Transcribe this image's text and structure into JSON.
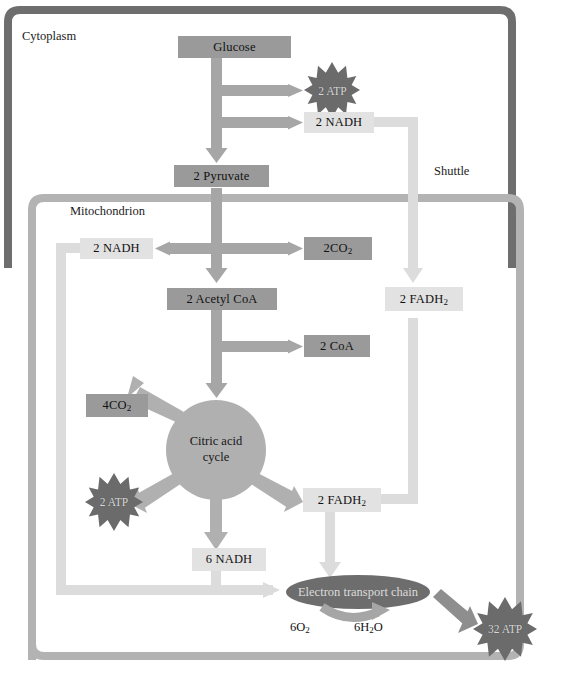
{
  "diagram": {
    "compartments": [
      {
        "id": "cytoplasm",
        "label": "Cytoplasm"
      },
      {
        "id": "mitochondrion",
        "label": "Mitochondrion"
      }
    ],
    "annotations": [
      {
        "id": "shuttle",
        "label": "Shuttle"
      }
    ],
    "nodes": [
      {
        "id": "glucose",
        "label": "Glucose",
        "style": "box-dark"
      },
      {
        "id": "atp2-glyc",
        "label": "2 ATP",
        "style": "starburst"
      },
      {
        "id": "nadh2-cyto",
        "label": "2 NADH",
        "style": "box-light"
      },
      {
        "id": "pyruvate2",
        "label": "2 Pyruvate",
        "style": "box-dark"
      },
      {
        "id": "nadh2-mito",
        "label": "2 NADH",
        "style": "box-light"
      },
      {
        "id": "co2-2",
        "label_html": "2CO<sub>2</sub>",
        "label": "2CO2",
        "style": "box-dark"
      },
      {
        "id": "acetylcoa2",
        "label": "2 Acetyl CoA",
        "style": "box-dark"
      },
      {
        "id": "fadh2-upper",
        "label_html": "2 FADH<sub>2</sub>",
        "label": "2 FADH2",
        "style": "box-light"
      },
      {
        "id": "coa2",
        "label": "2 CoA",
        "style": "box-dark"
      },
      {
        "id": "co2-4",
        "label_html": "4CO<sub>2</sub>",
        "label": "4CO2",
        "style": "box-dark"
      },
      {
        "id": "citric-acid-cycle",
        "label_line1": "Citric acid",
        "label_line2": "cycle",
        "style": "circle"
      },
      {
        "id": "atp2-krebs",
        "label": "2 ATP",
        "style": "starburst"
      },
      {
        "id": "fadh2-lower",
        "label_html": "2 FADH<sub>2</sub>",
        "label": "2 FADH2",
        "style": "box-light"
      },
      {
        "id": "nadh6",
        "label": "6 NADH",
        "style": "box-light"
      },
      {
        "id": "etc",
        "label": "Electron transport chain",
        "style": "ellipse"
      },
      {
        "id": "o2",
        "label_html": "6O<sub>2</sub>",
        "label": "6O2",
        "style": "plain"
      },
      {
        "id": "h2o",
        "label_html": "6H<sub>2</sub>O",
        "label": "6H2O",
        "style": "plain"
      },
      {
        "id": "atp32",
        "label": "32 ATP",
        "style": "starburst"
      }
    ],
    "colors": {
      "cytoplasm_border": "#6e6e6e",
      "mitochondrion_border": "#b3b3b3",
      "box_dark_fill": "#9a9a9a",
      "box_light_fill": "#e2e2e2",
      "arrow_dark": "#a6a6a6",
      "arrow_light": "#dcdcdc",
      "burst_fill": "#6b6b6b",
      "cycle_fill": "#b0b0b0",
      "etc_fill": "#6d6d6d",
      "text": "#111111",
      "background": "#ffffff"
    }
  }
}
